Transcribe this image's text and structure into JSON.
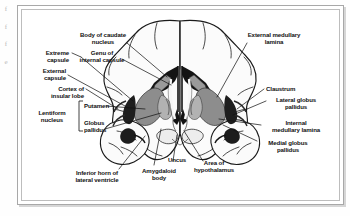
{
  "figure": {
    "type": "anatomical-diagram",
    "margin_marks": [
      "f",
      "f",
      "f",
      "e"
    ]
  },
  "labels": {
    "body_of_caudate_nucleus": "Body of caudate\nnucleus",
    "genu_of_internal_capsule": "Genu of\ninternal capsule",
    "extreme_capsule": "Extreme\ncapsule",
    "external_capsule": "External\ncapsule",
    "cortex_of_insular_lobe": "Cortex of\ninsular lobe",
    "lentiform_nucleus": "Lentiform\nnucleus",
    "putamen": "Putamen",
    "globus_pallidus": "Globus\npallidus",
    "inferior_horn_of_lateral_ventricle": "Inferior horn of\nlateral ventricle",
    "amygdaloid_body": "Amygdaloid\nbody",
    "uncus": "Uncus",
    "area_of_hypothalamus": "Area of\nhypothalamus",
    "external_medullary_lamina": "External medullary\nlamina",
    "claustrum": "Claustrum",
    "lateral_globus_pallidus": "Lateral globus\npallidus",
    "internal_medullary_lamina": "Internal\nmedullary lamina",
    "medial_globus_pallidus": "Medial globus\npallidus"
  },
  "colors": {
    "ink": "#111111",
    "frame": "#a8a8a8",
    "frame_inner": "#bdbdbd",
    "page": "#ffffff",
    "ventricle_black": "#111111",
    "nucleus_gray": "#8d8d8d",
    "nucleus_gray_light": "#b4b4b4",
    "cortex_fill": "#fbfbfb"
  }
}
